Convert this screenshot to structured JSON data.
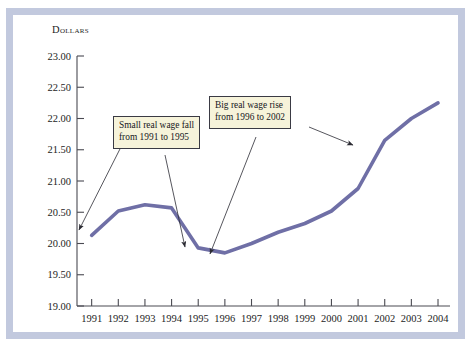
{
  "figure": {
    "axis_title": "Dollars",
    "line_color": "#6f6fa6",
    "callout_fill": "#f6f3da",
    "callout_border": "#3a3a44",
    "frame_color": "#c2c9de"
  },
  "annotations": [
    {
      "name": "callout-small-real-wage-fall",
      "line1": "Small real wage fall",
      "line2": "from 1991 to 1995"
    },
    {
      "name": "callout-big-real-wage-rise",
      "line1": "Big real wage rise",
      "line2": "from 1996 to 2002"
    }
  ],
  "chart_data": {
    "type": "line",
    "title": "",
    "subtitle": "",
    "xlabel": "",
    "ylabel": "Dollars",
    "grid": false,
    "legend": "none",
    "xlim": [
      1991,
      2004
    ],
    "ylim": [
      19.0,
      23.0
    ],
    "ytick_step": 0.5,
    "categories": [
      "1991",
      "1992",
      "1993",
      "1994",
      "1995",
      "1996",
      "1997",
      "1998",
      "1999",
      "2000",
      "2001",
      "2002",
      "2003",
      "2004"
    ],
    "ytick_labels": [
      "23.00",
      "22.50",
      "22.00",
      "21.50",
      "21.00",
      "20.50",
      "20.00",
      "19.50",
      "19.00"
    ],
    "series": [
      {
        "name": "Real wage",
        "color": "#6f6fa6",
        "values": [
          20.13,
          20.52,
          20.62,
          20.57,
          19.93,
          19.85,
          20.0,
          20.18,
          20.32,
          20.52,
          20.88,
          21.65,
          22.0,
          22.25
        ]
      }
    ],
    "annotations": [
      {
        "text": "Small real wage fall from 1991 to 1995",
        "points_to": [
          "1991",
          "1995"
        ]
      },
      {
        "text": "Big real wage rise from 1996 to 2002",
        "points_to": [
          "1996",
          "2002"
        ]
      }
    ]
  }
}
